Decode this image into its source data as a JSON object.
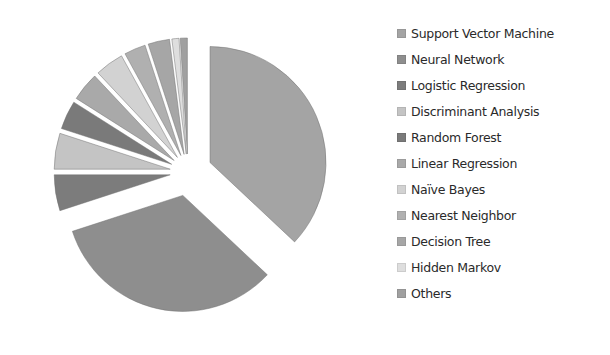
{
  "chart_data": {
    "type": "pie",
    "title": "",
    "exploded": true,
    "start_angle_deg": 0,
    "direction": "clockwise",
    "legend_position": "right",
    "categories": [
      "Support Vector Machine",
      "Neural Network",
      "Logistic Regression",
      "Discriminant Analysis",
      "Random Forest",
      "Linear Regression",
      "Naïve Bayes",
      "Nearest Neighbor",
      "Decision Tree",
      "Hidden Markov",
      "Others"
    ],
    "values": [
      37,
      33,
      5,
      5,
      4,
      4,
      4,
      3,
      3,
      1,
      1
    ],
    "colors": [
      "#a4a4a4",
      "#8e8e8e",
      "#7c7c7c",
      "#c4c4c4",
      "#7a7a7a",
      "#a9a9a9",
      "#d2d2d2",
      "#b0b0b0",
      "#a6a6a6",
      "#dedede",
      "#a0a0a0"
    ]
  },
  "legend": {
    "items": [
      {
        "label": "Support Vector Machine",
        "color": "#a4a4a4"
      },
      {
        "label": "Neural Network",
        "color": "#8e8e8e"
      },
      {
        "label": "Logistic Regression",
        "color": "#7c7c7c"
      },
      {
        "label": "Discriminant Analysis",
        "color": "#c4c4c4"
      },
      {
        "label": "Random Forest",
        "color": "#7a7a7a"
      },
      {
        "label": "Linear Regression",
        "color": "#a9a9a9"
      },
      {
        "label": "Naïve Bayes",
        "color": "#d2d2d2"
      },
      {
        "label": "Nearest Neighbor",
        "color": "#b0b0b0"
      },
      {
        "label": "Decision Tree",
        "color": "#a6a6a6"
      },
      {
        "label": "Hidden Markov",
        "color": "#dedede"
      },
      {
        "label": "Others",
        "color": "#a0a0a0"
      }
    ]
  }
}
